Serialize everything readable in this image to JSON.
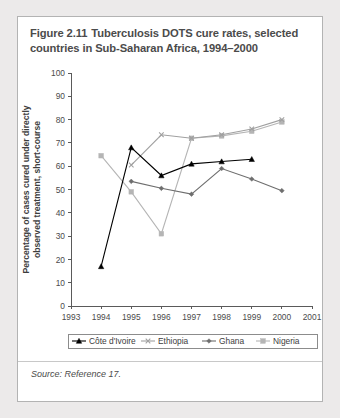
{
  "figure": {
    "number": "Figure 2.11",
    "title": "Tuberculosis DOTS cure rates, selected countries in Sub-Saharan Africa, 1994–2000",
    "source": "Source: Reference 17."
  },
  "chart_data": {
    "type": "line",
    "title": "Tuberculosis DOTS cure rates, selected countries in Sub-Saharan Africa, 1994–2000",
    "xlabel": "",
    "ylabel": "Percentage of cases cured under directly observed treatment, short-course",
    "x": [
      1993,
      1994,
      1995,
      1996,
      1997,
      1998,
      1999,
      2000,
      2001
    ],
    "xlim": [
      1993,
      2001
    ],
    "ylim": [
      0,
      100
    ],
    "xticks": [
      "1993",
      "1994",
      "1995",
      "1996",
      "1997",
      "1998",
      "1999",
      "2000",
      "2001"
    ],
    "yticks": [
      "0",
      "10",
      "20",
      "30",
      "40",
      "50",
      "60",
      "70",
      "80",
      "90",
      "100"
    ],
    "grid": false,
    "legend_position": "bottom",
    "series": [
      {
        "name": "Côte d'Ivoire",
        "marker": "triangle",
        "color": "#000000",
        "x": [
          1994,
          1995,
          1996,
          1997,
          1998,
          1999
        ],
        "values": [
          17,
          68,
          56,
          61,
          62,
          63
        ]
      },
      {
        "name": "Ethiopia",
        "marker": "x",
        "color": "#a0a0a0",
        "x": [
          1995,
          1996,
          1997,
          1998,
          1999,
          2000
        ],
        "values": [
          60.5,
          73.5,
          72,
          73.5,
          76,
          80
        ]
      },
      {
        "name": "Ghana",
        "marker": "diamond",
        "color": "#6e6e6e",
        "x": [
          1995,
          1996,
          1997,
          1998,
          1999,
          2000
        ],
        "values": [
          53.5,
          50.5,
          48,
          59,
          54.5,
          49.5
        ]
      },
      {
        "name": "Nigeria",
        "marker": "square",
        "color": "#b5b5b5",
        "x": [
          1994,
          1995,
          1996,
          1997,
          1998,
          1999,
          2000
        ],
        "values": [
          64.5,
          49,
          31,
          72,
          73,
          75,
          79
        ]
      }
    ]
  }
}
